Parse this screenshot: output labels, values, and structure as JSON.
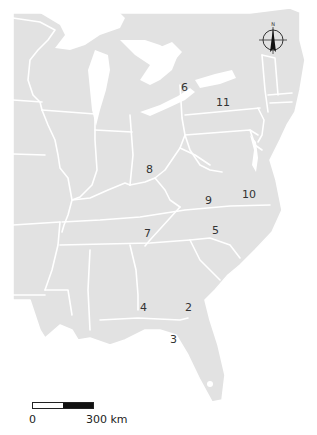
{
  "map": {
    "region": "Eastern United States",
    "land_color": "#e2e2e2",
    "boundary_color": "#ffffff",
    "background_color": "#ffffff",
    "labels": [
      {
        "id": "2",
        "text": "2",
        "x": 187,
        "y": 302
      },
      {
        "id": "3",
        "text": "3",
        "x": 171,
        "y": 334
      },
      {
        "id": "4",
        "text": "4",
        "x": 141,
        "y": 302
      },
      {
        "id": "5",
        "text": "5",
        "x": 212,
        "y": 225
      },
      {
        "id": "6",
        "text": "6",
        "x": 181,
        "y": 82
      },
      {
        "id": "7",
        "text": "7",
        "x": 145,
        "y": 228
      },
      {
        "id": "8",
        "text": "8",
        "x": 147,
        "y": 164
      },
      {
        "id": "9",
        "text": "9",
        "x": 205,
        "y": 194
      },
      {
        "id": "10",
        "text": "10",
        "x": 241,
        "y": 188
      },
      {
        "id": "11",
        "text": "11",
        "x": 215,
        "y": 97
      }
    ]
  },
  "compass": {
    "icon": "north-arrow-icon",
    "label": "N"
  },
  "scale_bar": {
    "start_label": "0",
    "end_label": "300 km"
  }
}
